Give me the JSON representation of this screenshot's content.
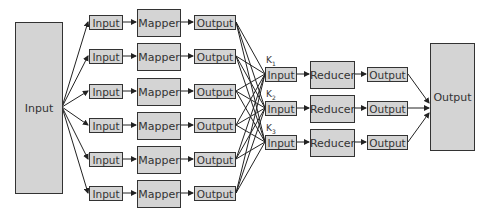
{
  "diagram": {
    "source": {
      "label": "Input"
    },
    "mappers": [
      {
        "input": "Input",
        "mapper": "Mapper",
        "output": "Output"
      },
      {
        "input": "Input",
        "mapper": "Mapper",
        "output": "Output"
      },
      {
        "input": "Input",
        "mapper": "Mapper",
        "output": "Output"
      },
      {
        "input": "Input",
        "mapper": "Mapper",
        "output": "Output"
      },
      {
        "input": "Input",
        "mapper": "Mapper",
        "output": "Output"
      },
      {
        "input": "Input",
        "mapper": "Mapper",
        "output": "Output"
      }
    ],
    "reducers": [
      {
        "key": "K",
        "key_sub": "1",
        "input": "Input",
        "reducer": "Reducer",
        "output": "Output"
      },
      {
        "key": "K",
        "key_sub": "2",
        "input": "Input",
        "reducer": "Reducer",
        "output": "Output"
      },
      {
        "key": "K",
        "key_sub": "3",
        "input": "Input",
        "reducer": "Reducer",
        "output": "Output"
      }
    ],
    "sink": {
      "label": "Output"
    },
    "colors": {
      "box_fill": "#d4d4d4",
      "stroke": "#333333"
    }
  }
}
